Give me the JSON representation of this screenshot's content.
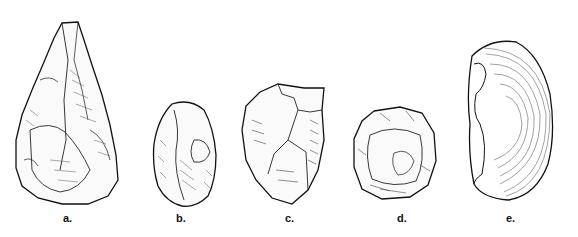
{
  "figure": {
    "items": [
      {
        "id": "a",
        "label": "a.",
        "description": "pear-shaped hand axe"
      },
      {
        "id": "b",
        "label": "b.",
        "description": "oval biface"
      },
      {
        "id": "c",
        "label": "c.",
        "description": "cleaver / chopper"
      },
      {
        "id": "d",
        "label": "d.",
        "description": "discoidal core"
      },
      {
        "id": "e",
        "label": "e.",
        "description": "flake with concentric ripples"
      }
    ],
    "colors": {
      "ink": "#111111",
      "background": "#ffffff"
    }
  }
}
